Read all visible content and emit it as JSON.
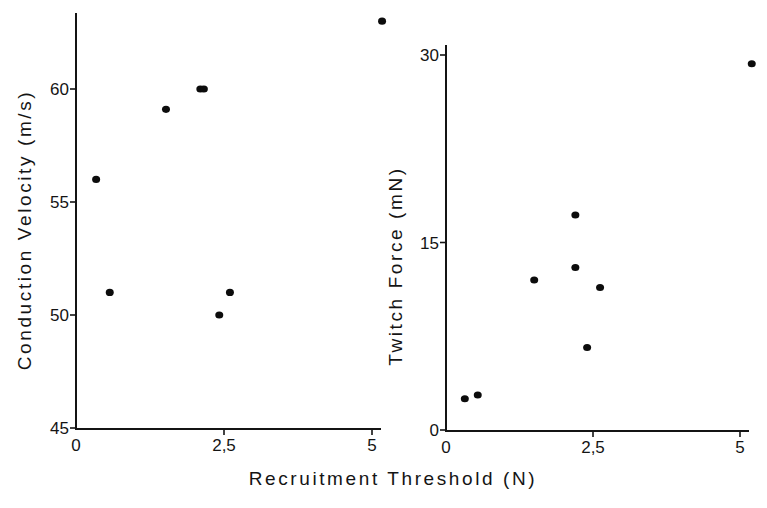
{
  "figure": {
    "shared_xlabel": "Recruitment Threshold (N)"
  },
  "chart_data": [
    {
      "type": "scatter",
      "title": "",
      "xlabel": "Recruitment Threshold (N)",
      "ylabel": "Conduction Velocity (m/s)",
      "xlim": [
        0,
        5
      ],
      "ylim": [
        45,
        63
      ],
      "x_ticks": [
        0,
        2.5,
        5
      ],
      "x_tick_labels": [
        "0",
        "2,5",
        "5"
      ],
      "y_ticks": [
        45,
        50,
        55,
        60
      ],
      "y_tick_labels": [
        "45",
        "50",
        "55",
        "60"
      ],
      "grid": false,
      "legend": null,
      "points": [
        {
          "x": 0.34,
          "y": 56.0
        },
        {
          "x": 0.57,
          "y": 51.0
        },
        {
          "x": 1.52,
          "y": 59.1
        },
        {
          "x": 2.1,
          "y": 60.0
        },
        {
          "x": 2.16,
          "y": 60.0
        },
        {
          "x": 2.42,
          "y": 50.0
        },
        {
          "x": 2.6,
          "y": 51.0
        },
        {
          "x": 5.17,
          "y": 63.0
        }
      ]
    },
    {
      "type": "scatter",
      "title": "",
      "xlabel": "Recruitment Threshold (N)",
      "ylabel": "Twitch Force (mN)",
      "xlim": [
        0,
        5
      ],
      "ylim": [
        0,
        30
      ],
      "x_ticks": [
        0,
        2.5,
        5
      ],
      "x_tick_labels": [
        "0",
        "2,5",
        "5"
      ],
      "y_ticks": [
        0,
        15,
        30
      ],
      "y_tick_labels": [
        "0",
        "15",
        "30"
      ],
      "grid": false,
      "legend": null,
      "points": [
        {
          "x": 0.32,
          "y": 2.5
        },
        {
          "x": 0.54,
          "y": 2.8
        },
        {
          "x": 1.5,
          "y": 12.0
        },
        {
          "x": 2.2,
          "y": 13.0
        },
        {
          "x": 2.2,
          "y": 17.2
        },
        {
          "x": 2.4,
          "y": 6.6
        },
        {
          "x": 2.62,
          "y": 11.4
        },
        {
          "x": 5.2,
          "y": 29.3
        }
      ]
    }
  ]
}
